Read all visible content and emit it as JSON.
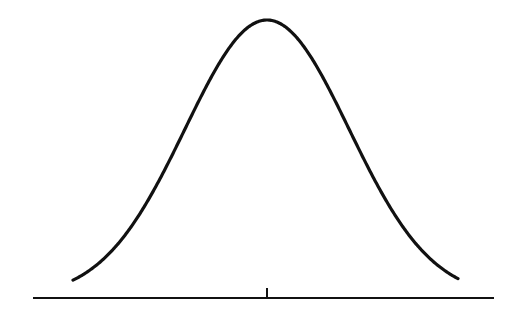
{
  "chart_data": {
    "type": "line",
    "title": "",
    "xlabel": "",
    "ylabel": "",
    "distribution": {
      "name": "normal",
      "mean": 0,
      "sd": 1
    },
    "x_range": [
      -3.6,
      3.6
    ],
    "ticks": [
      {
        "x": 0,
        "label": ""
      }
    ],
    "grid": false,
    "legend": null,
    "colors": {
      "line": "#111111",
      "axis": "#111111",
      "background": "#ffffff"
    }
  },
  "layout": {
    "axis_y_px": 298,
    "axis_x_start_px": 33,
    "axis_x_end_px": 494,
    "center_x_px": 267,
    "sigma_px": 82,
    "peak_y_px": 19,
    "curve_x_start_px": 73,
    "curve_x_end_px": 458,
    "tick_height_px": 10
  }
}
